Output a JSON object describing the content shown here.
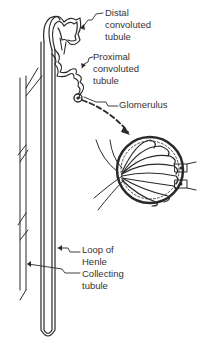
{
  "diagram": {
    "labels": {
      "distal": {
        "line1": "Distal",
        "line2": "convoluted",
        "line3": "tubule"
      },
      "proximal": {
        "line1": "Proximal",
        "line2": "convoluted",
        "line3": "tubule"
      },
      "glomerulus": {
        "line1": "Glomerulus"
      },
      "loop": {
        "line1": "Loop of",
        "line2": "Henle"
      },
      "collecting": {
        "line1": "Collecting",
        "line2": "tubule"
      }
    },
    "colors": {
      "ink": "#2a2a2a",
      "background": "#ffffff"
    }
  }
}
